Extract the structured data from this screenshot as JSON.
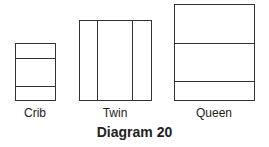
{
  "title": "Diagram 20",
  "beds": [
    {
      "label": "Crib",
      "divisions": "horizontal",
      "lines": 2
    },
    {
      "label": "Twin",
      "divisions": "vertical",
      "lines": 2
    },
    {
      "label": "Queen",
      "divisions": "horizontal",
      "lines": 2
    }
  ]
}
